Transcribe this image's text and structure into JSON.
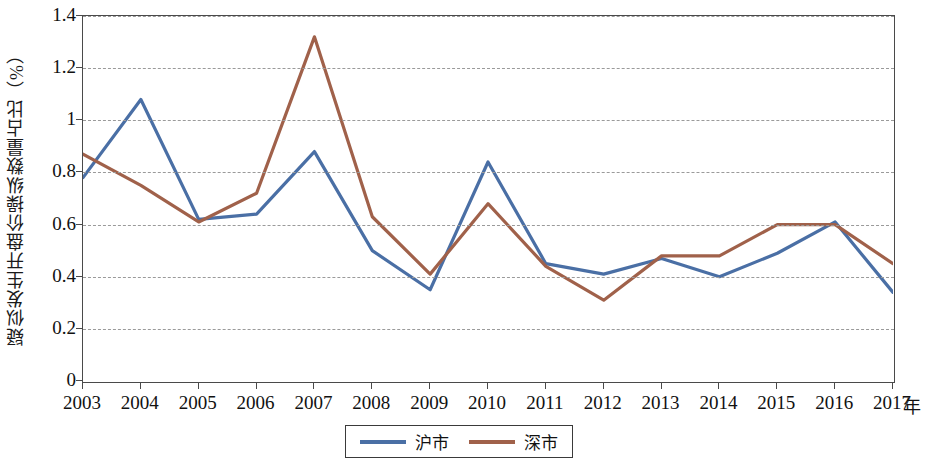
{
  "chart_data": {
    "type": "line",
    "title": "",
    "xlabel": "年",
    "ylabel": "疑似发生开盘价操纵数量占比（%）",
    "categories": [
      "2003",
      "2004",
      "2005",
      "2006",
      "2007",
      "2008",
      "2009",
      "2010",
      "2011",
      "2012",
      "2013",
      "2014",
      "2015",
      "2016",
      "2017"
    ],
    "ylim": [
      0,
      1.4
    ],
    "xlim_labels": [
      "2003",
      "2017"
    ],
    "y_ticks": [
      "0",
      "0.2",
      "0.4",
      "0.6",
      "0.8",
      "1",
      "1.2",
      "1.4"
    ],
    "y_tick_values": [
      0,
      0.2,
      0.4,
      0.6,
      0.8,
      1.0,
      1.2,
      1.4
    ],
    "grid": true,
    "grid_style": "dashed-horizontal",
    "legend_position": "bottom-center",
    "series": [
      {
        "name": "沪市",
        "color": "#4a6fa5",
        "values": [
          0.78,
          1.08,
          0.62,
          0.64,
          0.88,
          0.5,
          0.35,
          0.84,
          0.45,
          0.41,
          0.47,
          0.4,
          0.49,
          0.61,
          0.34
        ]
      },
      {
        "name": "深市",
        "color": "#a0614a",
        "values": [
          0.87,
          0.75,
          0.61,
          0.72,
          1.32,
          0.63,
          0.41,
          0.68,
          0.44,
          0.31,
          0.48,
          0.48,
          0.6,
          0.6,
          0.45
        ]
      }
    ]
  },
  "axis": {
    "y_title": "疑似发生开盘价操纵数量占比（%）",
    "x_unit": "年"
  },
  "legend": {
    "items": [
      {
        "label": "沪市",
        "color": "#4a6fa5"
      },
      {
        "label": "深市",
        "color": "#a0614a"
      }
    ]
  }
}
